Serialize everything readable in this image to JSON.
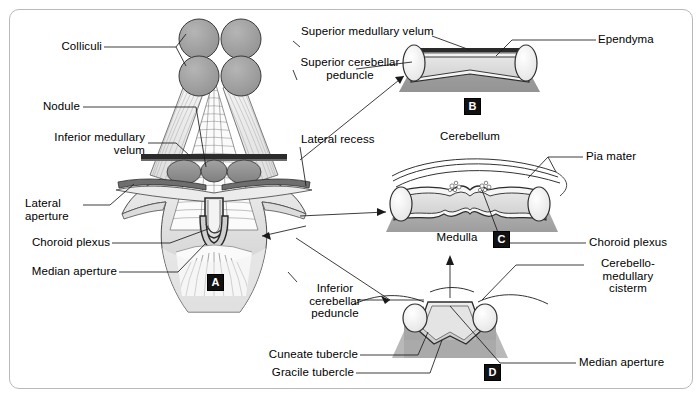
{
  "figure": {
    "caption": "",
    "panels": [
      {
        "id": "A",
        "letter": "A"
      },
      {
        "id": "B",
        "letter": "B"
      },
      {
        "id": "C",
        "letter": "C"
      },
      {
        "id": "D",
        "letter": "D"
      }
    ]
  },
  "labels": {
    "left": [
      {
        "key": "colliculi",
        "text": "Colliculi"
      },
      {
        "key": "nodule",
        "text": "Nodule"
      },
      {
        "key": "inferior_med_velum",
        "text": "Inferior medullary\n velum"
      },
      {
        "key": "lateral_aperture",
        "text": "Lateral\naperture"
      },
      {
        "key": "choroid_plexus_a",
        "text": "Choroid plexus"
      },
      {
        "key": "median_aperture_a",
        "text": "Median aperture"
      }
    ],
    "center": [
      {
        "key": "superior_med_velum",
        "text": "Superior medullary velum"
      },
      {
        "key": "superior_cer_ped",
        "text": "Superior cerebellar\npeduncle"
      },
      {
        "key": "lateral_recess",
        "text": "Lateral recess"
      },
      {
        "key": "cerebellum",
        "text": "Cerebellum"
      },
      {
        "key": "medulla",
        "text": "Medulla"
      },
      {
        "key": "inferior_cer_ped",
        "text": "Inferior\ncerebellar\npeduncle"
      },
      {
        "key": "cuneate_tubercle",
        "text": "Cuneate tubercle"
      },
      {
        "key": "gracile_tubercle",
        "text": "Gracile tubercle"
      }
    ],
    "right": [
      {
        "key": "ependyma",
        "text": "Ependyma"
      },
      {
        "key": "pia_mater",
        "text": "Pia mater"
      },
      {
        "key": "choroid_plexus_c",
        "text": "Choroid plexus"
      },
      {
        "key": "cerebello_med_cist",
        "text": "Cerebello-\nmedullary\ncisterm"
      },
      {
        "key": "median_aperture_d",
        "text": "Median aperture"
      }
    ]
  },
  "colors": {
    "frame_border": "#b9b9b9",
    "ink": "#1a1a1a",
    "light_gray": "#e9e9e9",
    "mid_gray": "#d0d0d0",
    "dark_gray": "#8f8f8f",
    "shadow_gray": "#a6a6a6",
    "collicular_gray": "#9e9e9e",
    "velum_dark": "#2b2b2b",
    "panel_badge": "#111111"
  }
}
